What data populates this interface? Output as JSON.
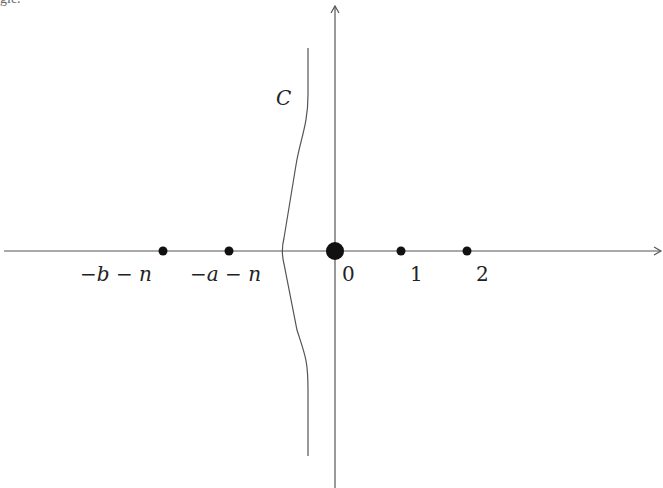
{
  "figure": {
    "top_fragment": "gle.",
    "contour_label": "C",
    "points": [
      {
        "label": "−b − n",
        "x": 163
      },
      {
        "label": "−a − n",
        "x": 229
      },
      {
        "label": "0",
        "x": 335
      },
      {
        "label": "1",
        "x": 401
      },
      {
        "label": "2",
        "x": 467
      }
    ],
    "colors": {
      "line": "#555555",
      "dot": "#111111",
      "text": "#222222"
    }
  }
}
